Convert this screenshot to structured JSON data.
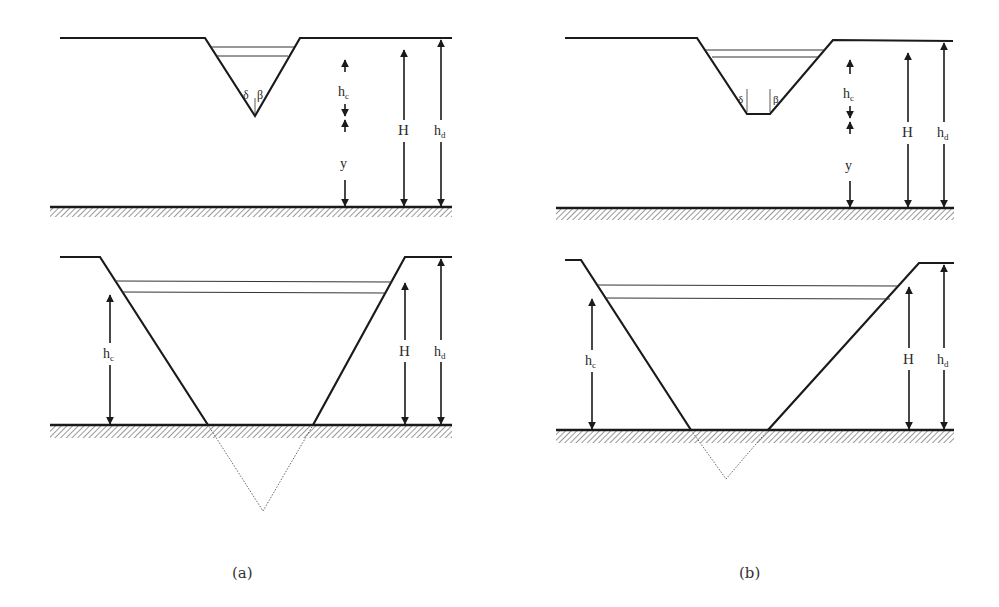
{
  "figure": {
    "panels": [
      {
        "id": "a",
        "caption": "(a)",
        "top": {
          "shape": "V-notch (triangular) crest",
          "angle_labels": [
            "δ",
            "β"
          ],
          "dimension_labels": {
            "critical_depth": "h",
            "critical_depth_sub": "c",
            "y": "y",
            "head": "H",
            "dam_height": "h",
            "dam_height_sub": "d"
          }
        },
        "bottom": {
          "shape": "wide triangular breach, apex below bed (dotted)",
          "dimension_labels": {
            "critical_depth": "h",
            "critical_depth_sub": "c",
            "head": "H",
            "dam_height": "h",
            "dam_height_sub": "d"
          }
        }
      },
      {
        "id": "b",
        "caption": "(b)",
        "top": {
          "shape": "trapezoidal crest",
          "angle_labels": [
            "δ",
            "β"
          ],
          "dimension_labels": {
            "critical_depth": "h",
            "critical_depth_sub": "c",
            "y": "y",
            "head": "H",
            "dam_height": "h",
            "dam_height_sub": "d"
          }
        },
        "bottom": {
          "shape": "wide trapezoidal breach, extended apex below bed (dotted)",
          "dimension_labels": {
            "critical_depth": "h",
            "critical_depth_sub": "c",
            "head": "H",
            "dam_height": "h",
            "dam_height_sub": "d"
          }
        }
      }
    ],
    "colors": {
      "line": "#1a1a1a",
      "hatch": "#555555",
      "background": "#ffffff"
    }
  }
}
